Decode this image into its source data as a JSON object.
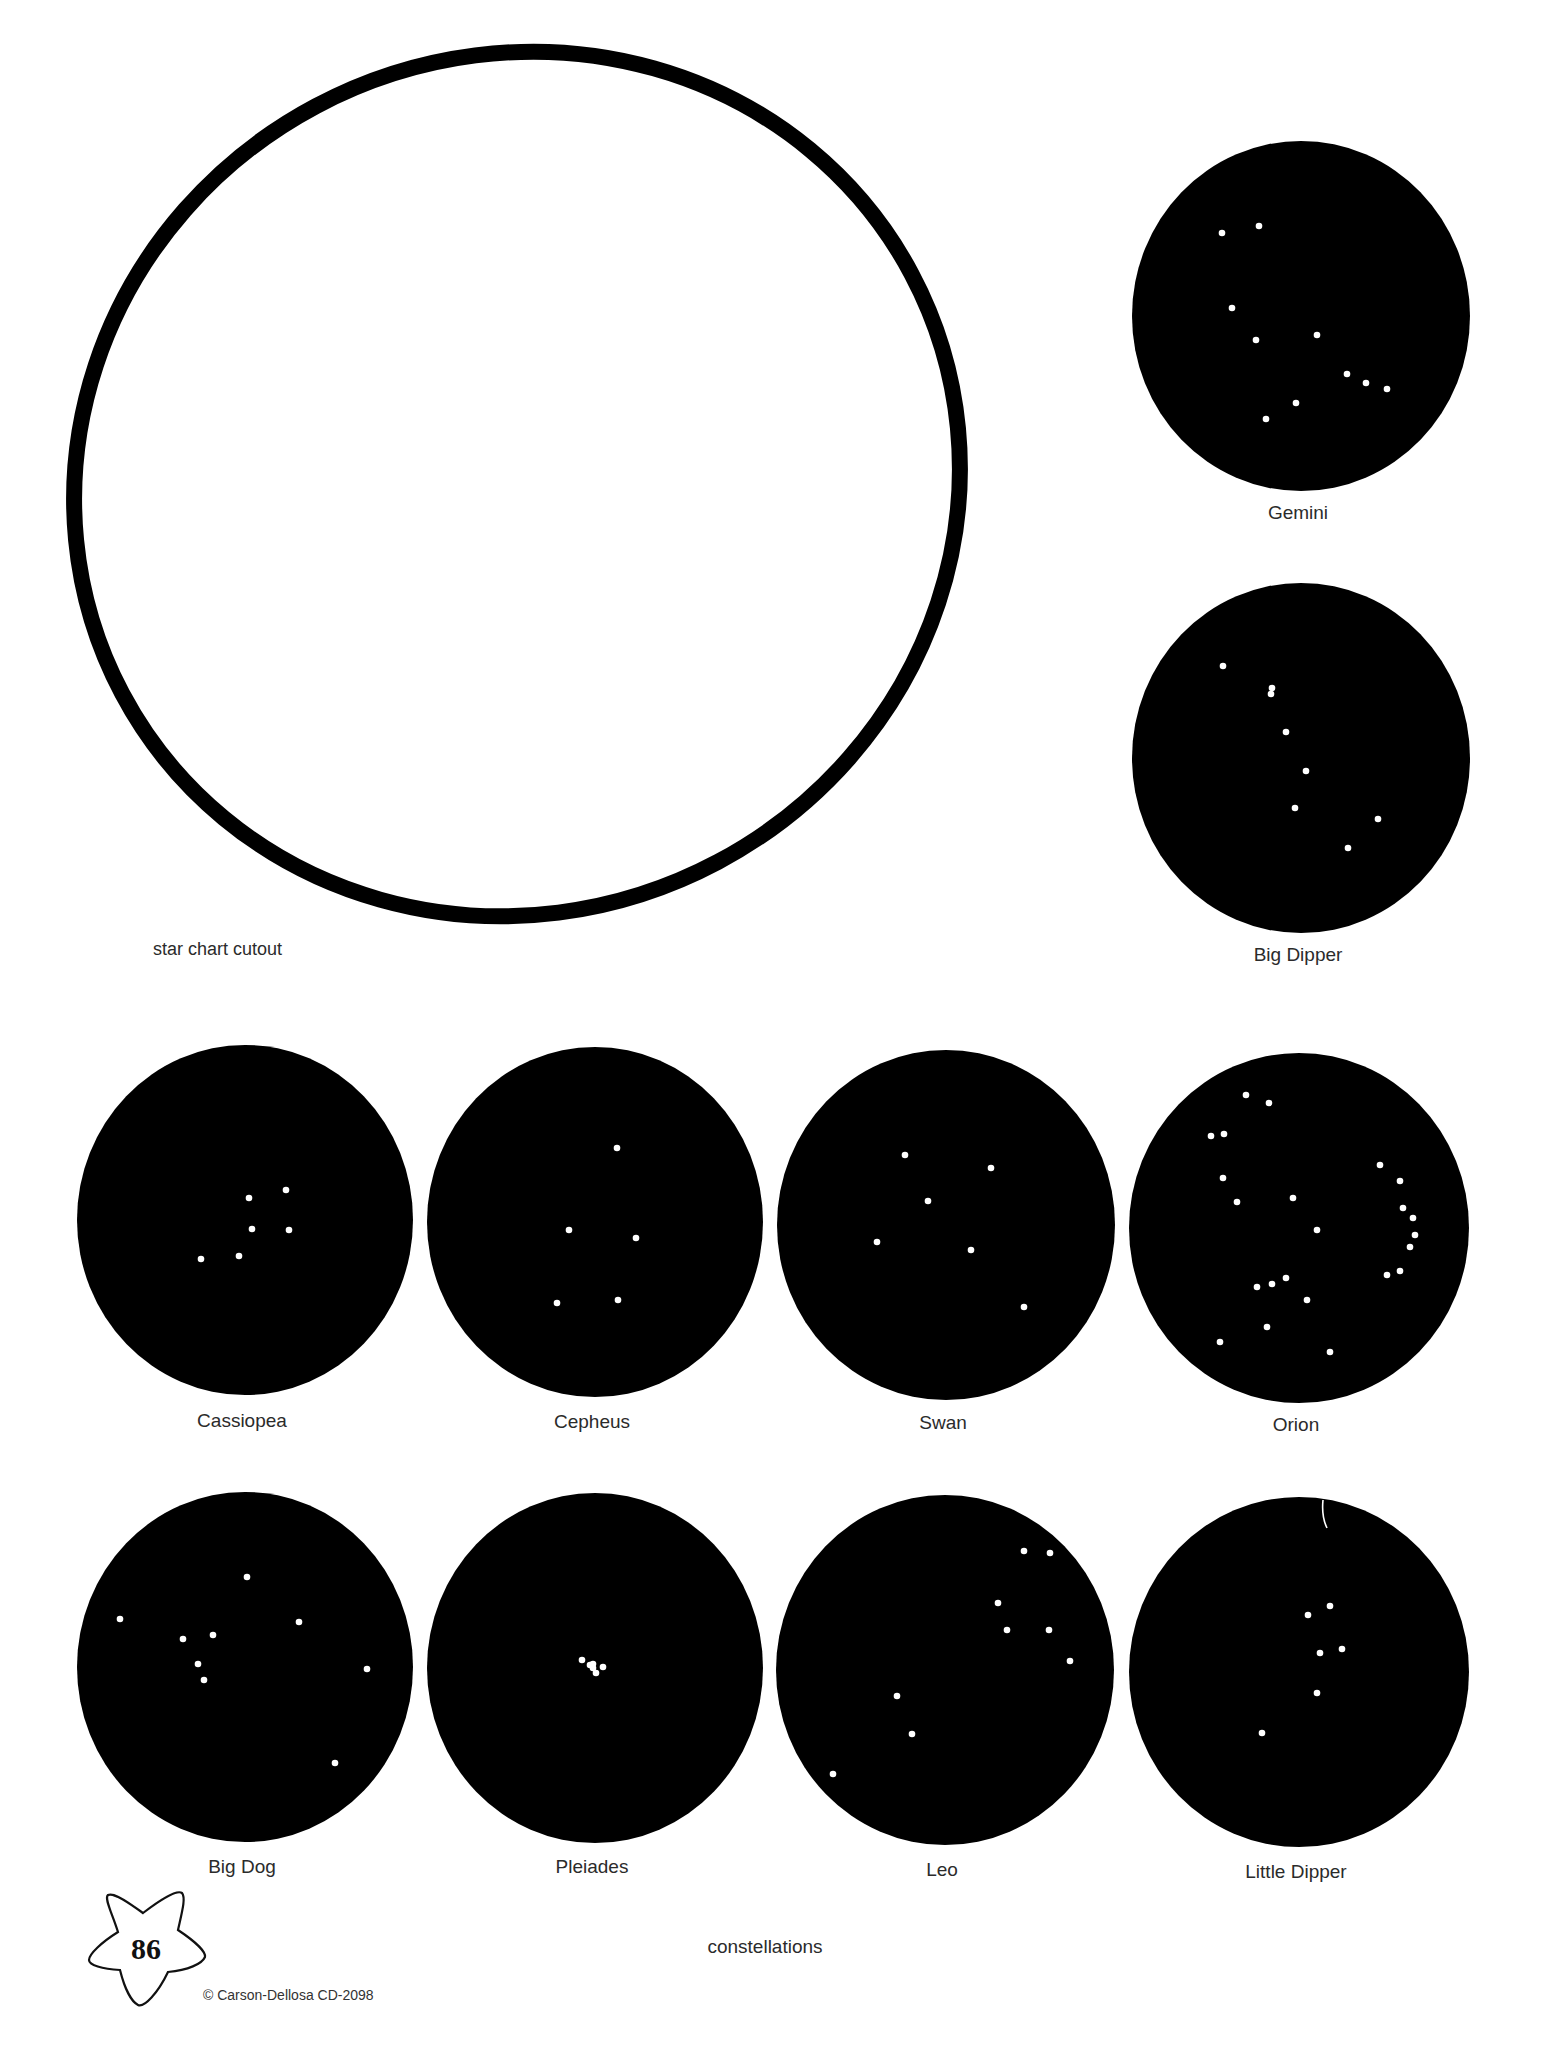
{
  "colors": {
    "background": "#ffffff",
    "ink": "#000000",
    "star": "#ffffff",
    "text": "#2b2b2b"
  },
  "cutout": {
    "label": "star chart cutout",
    "label_x": 153,
    "label_y": 955,
    "ellipse": {
      "cx": 517,
      "cy": 484,
      "rx": 447,
      "ry": 428,
      "rotate": -28,
      "stroke_width": 16
    }
  },
  "constellations": [
    {
      "name": "Gemini",
      "cx": 1301,
      "cy": 316,
      "rx": 169,
      "ry": 175,
      "label_y": 519,
      "stars": [
        [
          1222,
          233
        ],
        [
          1259,
          226
        ],
        [
          1232,
          308
        ],
        [
          1256,
          340
        ],
        [
          1317,
          335
        ],
        [
          1347,
          374
        ],
        [
          1366,
          383
        ],
        [
          1387,
          389
        ],
        [
          1296,
          403
        ],
        [
          1266,
          419
        ]
      ]
    },
    {
      "name": "Big Dipper",
      "cx": 1301,
      "cy": 758,
      "rx": 169,
      "ry": 175,
      "label_y": 961,
      "stars": [
        [
          1223,
          666
        ],
        [
          1272,
          688
        ],
        [
          1271,
          694
        ],
        [
          1286,
          732
        ],
        [
          1306,
          771
        ],
        [
          1295,
          808
        ],
        [
          1378,
          819
        ],
        [
          1348,
          848
        ]
      ]
    },
    {
      "name": "Cassiopea",
      "cx": 245,
      "cy": 1220,
      "rx": 168,
      "ry": 175,
      "label_y": 1427,
      "stars": [
        [
          249,
          1198
        ],
        [
          286,
          1190
        ],
        [
          252,
          1229
        ],
        [
          289,
          1230
        ],
        [
          201,
          1259
        ],
        [
          239,
          1256
        ]
      ]
    },
    {
      "name": "Cepheus",
      "cx": 595,
      "cy": 1222,
      "rx": 168,
      "ry": 175,
      "label_y": 1428,
      "stars": [
        [
          617,
          1148
        ],
        [
          569,
          1230
        ],
        [
          636,
          1238
        ],
        [
          557,
          1303
        ],
        [
          618,
          1300
        ]
      ]
    },
    {
      "name": "Swan",
      "cx": 946,
      "cy": 1225,
      "rx": 169,
      "ry": 175,
      "label_y": 1429,
      "stars": [
        [
          905,
          1155
        ],
        [
          991,
          1168
        ],
        [
          928,
          1201
        ],
        [
          877,
          1242
        ],
        [
          971,
          1250
        ],
        [
          1024,
          1307
        ]
      ]
    },
    {
      "name": "Orion",
      "cx": 1299,
      "cy": 1228,
      "rx": 170,
      "ry": 175,
      "label_y": 1431,
      "stars": [
        [
          1246,
          1095
        ],
        [
          1269,
          1103
        ],
        [
          1211,
          1136
        ],
        [
          1224,
          1134
        ],
        [
          1223,
          1178
        ],
        [
          1237,
          1202
        ],
        [
          1293,
          1198
        ],
        [
          1317,
          1230
        ],
        [
          1380,
          1165
        ],
        [
          1400,
          1181
        ],
        [
          1403,
          1208
        ],
        [
          1413,
          1218
        ],
        [
          1415,
          1235
        ],
        [
          1410,
          1247
        ],
        [
          1400,
          1271
        ],
        [
          1387,
          1275
        ],
        [
          1286,
          1278
        ],
        [
          1272,
          1284
        ],
        [
          1257,
          1287
        ],
        [
          1307,
          1300
        ],
        [
          1267,
          1327
        ],
        [
          1220,
          1342
        ],
        [
          1330,
          1352
        ]
      ]
    },
    {
      "name": "Big Dog",
      "cx": 245,
      "cy": 1667,
      "rx": 168,
      "ry": 175,
      "label_y": 1873,
      "stars": [
        [
          247,
          1577
        ],
        [
          120,
          1619
        ],
        [
          299,
          1622
        ],
        [
          183,
          1639
        ],
        [
          213,
          1635
        ],
        [
          198,
          1664
        ],
        [
          204,
          1680
        ],
        [
          367,
          1669
        ],
        [
          335,
          1763
        ]
      ]
    },
    {
      "name": "Pleiades",
      "cx": 595,
      "cy": 1668,
      "rx": 168,
      "ry": 175,
      "label_y": 1873,
      "stars": [
        [
          582,
          1660
        ],
        [
          590,
          1665
        ],
        [
          593,
          1668
        ],
        [
          596,
          1673
        ],
        [
          603,
          1667
        ],
        [
          593,
          1664
        ]
      ]
    },
    {
      "name": "Leo",
      "cx": 945,
      "cy": 1670,
      "rx": 169,
      "ry": 175,
      "label_y": 1876,
      "stars": [
        [
          1024,
          1551
        ],
        [
          1050,
          1553
        ],
        [
          998,
          1603
        ],
        [
          1007,
          1630
        ],
        [
          1049,
          1630
        ],
        [
          1070,
          1661
        ],
        [
          897,
          1696
        ],
        [
          912,
          1734
        ],
        [
          833,
          1774
        ]
      ]
    },
    {
      "name": "Little Dipper",
      "cx": 1299,
      "cy": 1672,
      "rx": 170,
      "ry": 175,
      "label_y": 1878,
      "stars": [
        [
          1330,
          1606
        ],
        [
          1308,
          1615
        ],
        [
          1320,
          1653
        ],
        [
          1342,
          1649
        ],
        [
          1317,
          1693
        ],
        [
          1262,
          1733
        ]
      ]
    }
  ],
  "footer": {
    "section_label": "constellations",
    "page_number": "86",
    "copyright": "© Carson-Dellosa CD-2098"
  }
}
